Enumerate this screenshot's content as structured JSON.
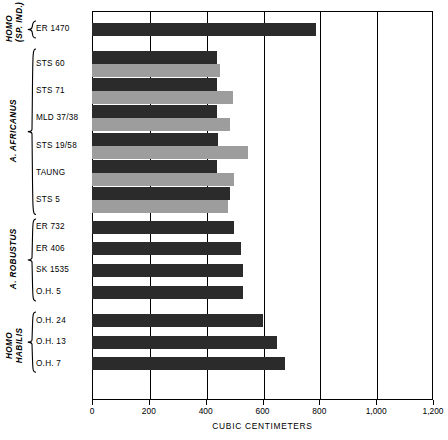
{
  "chart_data": {
    "type": "bar",
    "orientation": "horizontal",
    "title": "",
    "xlabel": "CUBIC CENTIMETERS",
    "ylabel": "",
    "xlim": [
      0,
      1200
    ],
    "xticks": [
      0,
      200,
      400,
      600,
      800,
      1000,
      1200
    ],
    "xtick_labels": [
      "0",
      "200",
      "400",
      "600",
      "800",
      "1,000",
      "1,200"
    ],
    "grid": true,
    "legend": "none",
    "series": [
      {
        "name": "endocranial-volume-dark",
        "color": "#2b2b2b"
      },
      {
        "name": "endocranial-volume-gray",
        "color": "#9d9d9d"
      }
    ],
    "groups": [
      {
        "name": "HOMO",
        "name_line2": "(SP. IND.)",
        "specimens": [
          {
            "label": "ER 1470",
            "dark": 790,
            "gray": null
          }
        ]
      },
      {
        "name": "A. AFRICANUS",
        "name_line2": "",
        "specimens": [
          {
            "label": "STS 60",
            "dark": 440,
            "gray": 450
          },
          {
            "label": "STS 71",
            "dark": 440,
            "gray": 495
          },
          {
            "label": "MLD 37/38",
            "dark": 440,
            "gray": 485
          },
          {
            "label": "STS 19/58",
            "dark": 445,
            "gray": 550
          },
          {
            "label": "TAUNG",
            "dark": 440,
            "gray": 500
          },
          {
            "label": "STS 5",
            "dark": 485,
            "gray": 480
          }
        ]
      },
      {
        "name": "A. ROBUSTUS",
        "name_line2": "",
        "specimens": [
          {
            "label": "ER 732",
            "dark": 500,
            "gray": null
          },
          {
            "label": "ER 406",
            "dark": 525,
            "gray": null
          },
          {
            "label": "SK 1535",
            "dark": 530,
            "gray": null
          },
          {
            "label": "O.H. 5",
            "dark": 530,
            "gray": null
          }
        ]
      },
      {
        "name": "HOMO",
        "name_line2": "HABILIS",
        "specimens": [
          {
            "label": "O.H. 24",
            "dark": 600,
            "gray": null
          },
          {
            "label": "O.H. 13",
            "dark": 650,
            "gray": null
          },
          {
            "label": "O.H. 7",
            "dark": 680,
            "gray": null
          }
        ]
      }
    ]
  },
  "labels": {
    "specimens": [
      "ER 1470",
      "STS 60",
      "STS 71",
      "MLD 37/38",
      "STS 19/58",
      "TAUNG",
      "STS 5",
      "ER 732",
      "ER 406",
      "SK 1535",
      "O.H. 5",
      "O.H. 24",
      "O.H. 13",
      "O.H. 7"
    ],
    "groups": [
      {
        "line1": "HOMO",
        "line2": "(SP. IND.)"
      },
      {
        "line1": "A. AFRICANUS",
        "line2": ""
      },
      {
        "line1": "A. ROBUSTUS",
        "line2": ""
      },
      {
        "line1": "HOMO",
        "line2": "HABILIS"
      }
    ],
    "xticks": [
      "0",
      "200",
      "400",
      "600",
      "800",
      "1,000",
      "1,200"
    ],
    "xaxis_title": "CUBIC CENTIMETERS"
  },
  "colors": {
    "bar_dark": "#2b2b2b",
    "bar_gray": "#9d9d9d",
    "axis": "#000000",
    "background": "#ffffff"
  }
}
